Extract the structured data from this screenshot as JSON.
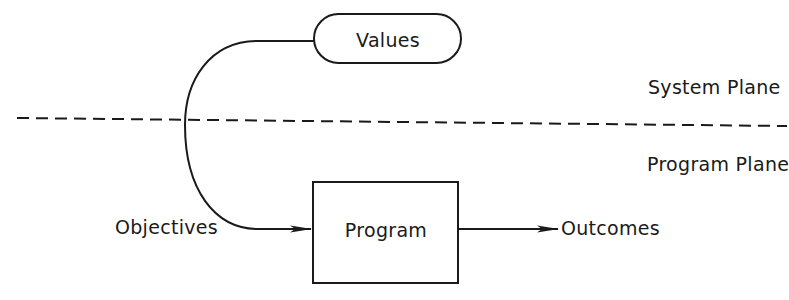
{
  "diagram": {
    "nodes": {
      "values": {
        "label": "Values",
        "shape": "rounded-pill"
      },
      "program": {
        "label": "Program",
        "shape": "rectangle"
      }
    },
    "edge_labels": {
      "objectives": "Objectives",
      "outcomes": "Outcomes"
    },
    "planes": {
      "system": "System Plane",
      "program": "Program Plane"
    },
    "edges": [
      {
        "from": "values",
        "to": "program",
        "label": "Objectives",
        "style": "curved-arrow"
      },
      {
        "from": "program",
        "to": "outcomes",
        "label": "Outcomes",
        "style": "straight-arrow"
      }
    ],
    "divider": {
      "style": "dashed",
      "separates": [
        "System Plane",
        "Program Plane"
      ]
    },
    "colors": {
      "ink": "#1a1a1a",
      "background": "#ffffff"
    }
  }
}
